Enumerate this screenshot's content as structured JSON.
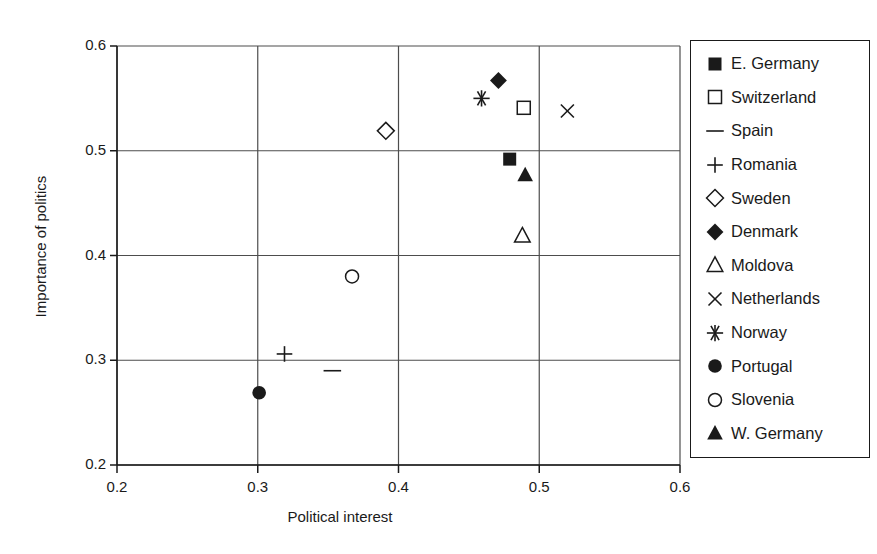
{
  "chart_data": {
    "type": "scatter",
    "title": "",
    "xlabel": "Political interest",
    "ylabel": "Importance of politics",
    "xlim": [
      0.2,
      0.6
    ],
    "ylim": [
      0.2,
      0.6
    ],
    "xticks": [
      "0.2",
      "0.3",
      "0.4",
      "0.5",
      "0.6"
    ],
    "yticks": [
      "0.2",
      "0.3",
      "0.4",
      "0.5",
      "0.6"
    ],
    "xtick_values": [
      0.2,
      0.3,
      0.4,
      0.5,
      0.6
    ],
    "ytick_values": [
      0.2,
      0.3,
      0.4,
      0.5,
      0.6
    ],
    "grid": true,
    "legend_position": "right",
    "points": [
      {
        "label": "E. Germany",
        "marker": "filled-square",
        "x": 0.479,
        "y": 0.492
      },
      {
        "label": "Switzerland",
        "marker": "open-square",
        "x": 0.489,
        "y": 0.541
      },
      {
        "label": "Spain",
        "marker": "dash",
        "x": 0.353,
        "y": 0.29
      },
      {
        "label": "Romania",
        "marker": "plus",
        "x": 0.319,
        "y": 0.306
      },
      {
        "label": "Sweden",
        "marker": "open-diamond",
        "x": 0.391,
        "y": 0.519
      },
      {
        "label": "Denmark",
        "marker": "filled-diamond",
        "x": 0.471,
        "y": 0.567
      },
      {
        "label": "Moldova",
        "marker": "open-triangle",
        "x": 0.488,
        "y": 0.419
      },
      {
        "label": "Netherlands",
        "marker": "cross",
        "x": 0.52,
        "y": 0.538
      },
      {
        "label": "Norway",
        "marker": "asterisk",
        "x": 0.459,
        "y": 0.55
      },
      {
        "label": "Portugal",
        "marker": "filled-circle",
        "x": 0.301,
        "y": 0.269
      },
      {
        "label": "Slovenia",
        "marker": "open-circle",
        "x": 0.367,
        "y": 0.38
      },
      {
        "label": "W. Germany",
        "marker": "filled-triangle",
        "x": 0.49,
        "y": 0.477
      }
    ]
  },
  "legend": {
    "entries": [
      {
        "label": "E. Germany",
        "marker": "filled-square"
      },
      {
        "label": "Switzerland",
        "marker": "open-square"
      },
      {
        "label": "Spain",
        "marker": "dash"
      },
      {
        "label": "Romania",
        "marker": "plus"
      },
      {
        "label": "Sweden",
        "marker": "open-diamond"
      },
      {
        "label": "Denmark",
        "marker": "filled-diamond"
      },
      {
        "label": "Moldova",
        "marker": "open-triangle"
      },
      {
        "label": "Netherlands",
        "marker": "cross"
      },
      {
        "label": "Norway",
        "marker": "asterisk"
      },
      {
        "label": "Portugal",
        "marker": "filled-circle"
      },
      {
        "label": "Slovenia",
        "marker": "open-circle"
      },
      {
        "label": "W. Germany",
        "marker": "filled-triangle"
      }
    ]
  },
  "colors": {
    "ink": "#1a1a1a",
    "grid": "#4d4d4d",
    "background": "#ffffff"
  }
}
